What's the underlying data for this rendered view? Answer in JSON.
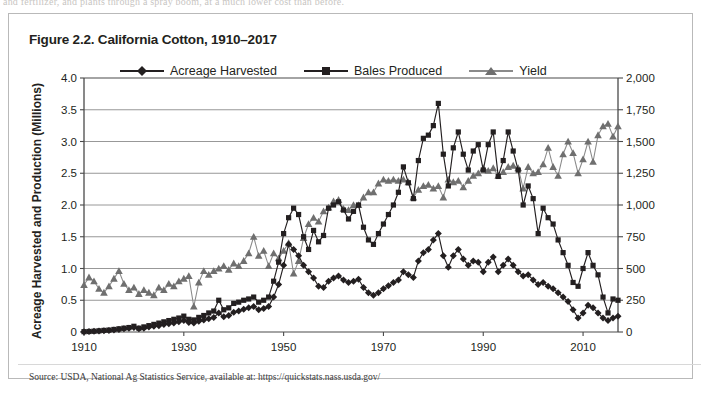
{
  "page": {
    "bleed_text": "and fertilizer, and plants through a spray boom, at a much lower cost than before."
  },
  "figure": {
    "title": "Figure 2.2. California Cotton, 1910–2017",
    "source": "Source: USDA, National Ag Statistics Service, available at: https://quickstats.nass.usda.gov/"
  },
  "legend": {
    "items": [
      {
        "label": "Acreage Harvested",
        "marker": "diamond-marker",
        "color": "#231f20"
      },
      {
        "label": "Bales Produced",
        "marker": "square-marker",
        "color": "#231f20"
      },
      {
        "label": "Yield",
        "marker": "triangle-marker",
        "color": "#7d7d7d"
      }
    ]
  },
  "chart_data": {
    "type": "line",
    "title": "Figure 2.2. California Cotton, 1910–2017",
    "xlabel": "",
    "ylabel": "Acreage Harvested and Production (Millions)",
    "y2label": "Yields in Pounds per Acre Harvested",
    "xlim": [
      1910,
      2017
    ],
    "ylim": [
      0,
      4.0
    ],
    "y2lim": [
      0,
      2000
    ],
    "grid": true,
    "legend_position": "top-center",
    "xticks": [
      1910,
      1930,
      1950,
      1970,
      1990,
      2010
    ],
    "yticks": [
      "0",
      "0.5",
      "1.0",
      "1.5",
      "2.0",
      "2.5",
      "3.0",
      "3.5",
      "4.0"
    ],
    "y2ticks": [
      "0",
      "250",
      "500",
      "750",
      "1,000",
      "1,250",
      "1,500",
      "1,750",
      "2,000"
    ],
    "x": [
      1910,
      1911,
      1912,
      1913,
      1914,
      1915,
      1916,
      1917,
      1918,
      1919,
      1920,
      1921,
      1922,
      1923,
      1924,
      1925,
      1926,
      1927,
      1928,
      1929,
      1930,
      1931,
      1932,
      1933,
      1934,
      1935,
      1936,
      1937,
      1938,
      1939,
      1940,
      1941,
      1942,
      1943,
      1944,
      1945,
      1946,
      1947,
      1948,
      1949,
      1950,
      1951,
      1952,
      1953,
      1954,
      1955,
      1956,
      1957,
      1958,
      1959,
      1960,
      1961,
      1962,
      1963,
      1964,
      1965,
      1966,
      1967,
      1968,
      1969,
      1970,
      1971,
      1972,
      1973,
      1974,
      1975,
      1976,
      1977,
      1978,
      1979,
      1980,
      1981,
      1982,
      1983,
      1984,
      1985,
      1986,
      1987,
      1988,
      1989,
      1990,
      1991,
      1992,
      1993,
      1994,
      1995,
      1996,
      1997,
      1998,
      1999,
      2000,
      2001,
      2002,
      2003,
      2004,
      2005,
      2006,
      2007,
      2008,
      2009,
      2010,
      2011,
      2012,
      2013,
      2014,
      2015,
      2016,
      2017
    ],
    "series": [
      {
        "name": "Acreage Harvested",
        "axis": "left",
        "units": "millions of acres",
        "values": [
          0.004,
          0.006,
          0.01,
          0.015,
          0.02,
          0.025,
          0.03,
          0.04,
          0.05,
          0.06,
          0.07,
          0.05,
          0.06,
          0.08,
          0.09,
          0.1,
          0.12,
          0.13,
          0.14,
          0.16,
          0.18,
          0.15,
          0.14,
          0.17,
          0.19,
          0.21,
          0.23,
          0.3,
          0.24,
          0.26,
          0.31,
          0.33,
          0.36,
          0.38,
          0.4,
          0.35,
          0.37,
          0.4,
          0.55,
          0.75,
          1.05,
          1.38,
          1.3,
          1.2,
          1.05,
          0.95,
          0.85,
          0.72,
          0.7,
          0.8,
          0.85,
          0.88,
          0.82,
          0.78,
          0.8,
          0.83,
          0.7,
          0.62,
          0.58,
          0.62,
          0.68,
          0.73,
          0.78,
          0.82,
          0.95,
          0.9,
          0.86,
          1.12,
          1.25,
          1.3,
          1.45,
          1.55,
          1.2,
          1.02,
          1.2,
          1.3,
          1.15,
          1.05,
          1.12,
          1.1,
          0.95,
          1.1,
          1.18,
          0.95,
          1.05,
          1.15,
          1.05,
          0.95,
          0.88,
          0.9,
          0.82,
          0.75,
          0.78,
          0.72,
          0.68,
          0.62,
          0.55,
          0.48,
          0.35,
          0.22,
          0.3,
          0.42,
          0.38,
          0.3,
          0.22,
          0.18,
          0.22,
          0.25
        ]
      },
      {
        "name": "Bales Produced",
        "axis": "left",
        "units": "millions of bales",
        "values": [
          0.005,
          0.008,
          0.012,
          0.018,
          0.025,
          0.03,
          0.04,
          0.05,
          0.06,
          0.07,
          0.09,
          0.06,
          0.08,
          0.1,
          0.12,
          0.14,
          0.16,
          0.18,
          0.2,
          0.22,
          0.25,
          0.2,
          0.19,
          0.23,
          0.26,
          0.3,
          0.33,
          0.5,
          0.35,
          0.38,
          0.45,
          0.47,
          0.5,
          0.52,
          0.55,
          0.47,
          0.5,
          0.55,
          0.8,
          1.1,
          1.55,
          1.8,
          1.95,
          1.85,
          1.5,
          1.3,
          1.6,
          1.42,
          1.52,
          1.95,
          2.0,
          2.05,
          1.92,
          1.78,
          1.9,
          2.0,
          1.65,
          1.45,
          1.38,
          1.55,
          1.7,
          1.85,
          2.0,
          2.2,
          2.6,
          2.35,
          2.1,
          2.7,
          3.05,
          3.1,
          3.25,
          3.6,
          2.8,
          2.3,
          2.9,
          3.15,
          2.8,
          2.55,
          2.85,
          2.95,
          2.55,
          2.95,
          3.15,
          2.45,
          2.7,
          3.15,
          2.85,
          2.55,
          2.0,
          2.3,
          2.1,
          1.55,
          1.95,
          1.8,
          1.7,
          1.45,
          1.25,
          1.05,
          0.78,
          0.72,
          1.0,
          1.25,
          1.05,
          0.9,
          0.55,
          0.3,
          0.52,
          0.5
        ]
      },
      {
        "name": "Yield",
        "axis": "right",
        "units": "pounds per acre harvested",
        "values": [
          370,
          430,
          400,
          340,
          310,
          360,
          420,
          480,
          380,
          330,
          350,
          300,
          330,
          310,
          290,
          350,
          330,
          380,
          360,
          400,
          420,
          440,
          200,
          390,
          480,
          450,
          480,
          500,
          520,
          490,
          540,
          520,
          560,
          620,
          750,
          600,
          640,
          520,
          620,
          580,
          640,
          700,
          460,
          560,
          740,
          850,
          900,
          870,
          950,
          980,
          1030,
          1040,
          970,
          960,
          1000,
          1000,
          1060,
          1100,
          1100,
          1170,
          1200,
          1190,
          1200,
          1190,
          1200,
          1180,
          1060,
          1120,
          1150,
          1160,
          1130,
          1150,
          1060,
          1200,
          1180,
          1190,
          1140,
          1190,
          1230,
          1250,
          1290,
          1270,
          1290,
          1230,
          1260,
          1300,
          1310,
          1290,
          1130,
          1300,
          1250,
          1260,
          1320,
          1450,
          1300,
          1230,
          1400,
          1500,
          1410,
          1250,
          1360,
          1500,
          1340,
          1550,
          1620,
          1640,
          1540,
          1620
        ]
      }
    ]
  }
}
